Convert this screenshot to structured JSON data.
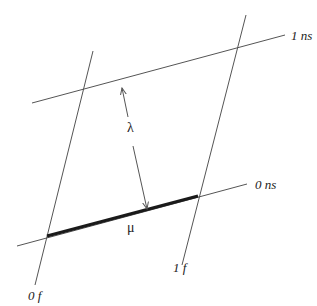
{
  "diagram": {
    "colors": {
      "line": "#555555",
      "thick_line": "#1a1a1a",
      "text": "#222222",
      "background": "#ffffff"
    },
    "lines": [
      {
        "id": "worldline-0f",
        "label": "0 f",
        "x1": 93,
        "y1": 51,
        "x2": 35,
        "y2": 285
      },
      {
        "id": "worldline-1f",
        "label": "1 f",
        "x1": 246,
        "y1": 15,
        "x2": 182,
        "y2": 265
      },
      {
        "id": "simultaneity-1ns",
        "label": "1 ns",
        "x1": 32,
        "y1": 103,
        "x2": 285,
        "y2": 35
      },
      {
        "id": "simultaneity-0ns",
        "label": "0 ns",
        "x1": 17,
        "y1": 246,
        "x2": 247,
        "y2": 184
      }
    ],
    "segments": [
      {
        "id": "mu-segment",
        "label": "μ",
        "x1": 47,
        "y1": 236,
        "x2": 198,
        "y2": 196
      }
    ],
    "arrows": [
      {
        "id": "lambda-arrow",
        "label": "λ",
        "x1": 122,
        "y1": 87,
        "x2": 147,
        "y2": 210,
        "double_headed": true
      }
    ],
    "labels": {
      "top_line": "1 ns",
      "bottom_line": "0 ns",
      "left_line": "0 f",
      "right_line": "1 f",
      "lambda": "λ",
      "mu": "μ"
    }
  }
}
